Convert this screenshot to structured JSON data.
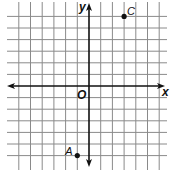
{
  "plane": {
    "x_range": [
      -7,
      6
    ],
    "y_range": [
      -7,
      7
    ],
    "grid_step": 1,
    "x_axis_label": "x",
    "y_axis_label": "y",
    "origin_label": "O"
  },
  "points": [
    {
      "label": "C",
      "x": 3,
      "y": 6
    },
    {
      "label": "A",
      "x": -1,
      "y": -6
    }
  ],
  "colors": {
    "grid": "#8a8a8a",
    "axis": "#111111",
    "point": "#111111"
  }
}
